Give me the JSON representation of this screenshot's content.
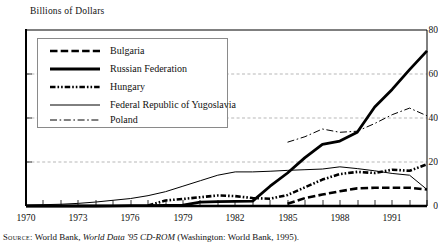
{
  "axis_title": "Billions of Dollars",
  "source": {
    "label": "Source:",
    "text_before": "World Bank,",
    "italic": "World Data '95 CD-ROM",
    "text_after": "(Washington: World Bank, 1995)."
  },
  "legend": {
    "entries": [
      {
        "label": "Bulgaria",
        "style": "thick-dashed"
      },
      {
        "label": "Russian Federation",
        "style": "thick-solid"
      },
      {
        "label": "Hungary",
        "style": "thick-dash-dot-dot"
      },
      {
        "label": "Federal Republic of Yugoslavia",
        "style": "thin-solid"
      },
      {
        "label": "Poland",
        "style": "thin-dash-dot"
      }
    ]
  },
  "chart_data": {
    "type": "line",
    "title": "Billions of Dollars",
    "xlabel": "",
    "ylabel": "Billions of Dollars",
    "xlim": [
      1970,
      1993
    ],
    "ylim": [
      0,
      80
    ],
    "yticks": [
      0,
      20,
      40,
      60,
      80
    ],
    "xticks": [
      1970,
      1973,
      1976,
      1979,
      1982,
      1985,
      1988,
      1991
    ],
    "xtick_labels": [
      "1970",
      "1973",
      "1976",
      "1979",
      "1982",
      "1985",
      "1988",
      "1991"
    ],
    "ytick_labels": [
      "0",
      "20",
      "40",
      "60",
      "80"
    ],
    "grid": "horizontal-dashed",
    "legend_position": "upper-left-inset",
    "x": [
      1970,
      1971,
      1972,
      1973,
      1974,
      1975,
      1976,
      1977,
      1978,
      1979,
      1980,
      1981,
      1982,
      1983,
      1984,
      1985,
      1986,
      1987,
      1988,
      1989,
      1990,
      1991,
      1992,
      1993
    ],
    "series": [
      {
        "name": "Bulgaria",
        "style": "thick-dashed",
        "x": [
          1985,
          1986,
          1987,
          1988,
          1989,
          1990,
          1991,
          1992,
          1993
        ],
        "values": [
          1.0,
          3.6,
          5.2,
          6.7,
          8.0,
          8.3,
          8.3,
          8.3,
          7.5
        ]
      },
      {
        "name": "Russian Federation",
        "style": "thick-solid",
        "x": [
          1970,
          1971,
          1972,
          1973,
          1974,
          1975,
          1976,
          1977,
          1978,
          1979,
          1980,
          1981,
          1982,
          1983,
          1984,
          1985,
          1986,
          1987,
          1988,
          1989,
          1990,
          1991,
          1992,
          1993
        ],
        "values": [
          0.0,
          0.0,
          0.0,
          0.0,
          0.0,
          0.1,
          0.2,
          0.2,
          0.3,
          0.4,
          1.8,
          2.0,
          2.1,
          2.2,
          9.0,
          15.0,
          22.0,
          28.0,
          29.5,
          33.5,
          45.0,
          53.0,
          62.0,
          70.5
        ]
      },
      {
        "name": "Hungary",
        "style": "thick-dash-dot-dot",
        "x": [
          1977,
          1978,
          1979,
          1980,
          1981,
          1982,
          1983,
          1984,
          1985,
          1986,
          1987,
          1988,
          1989,
          1990,
          1991,
          1992,
          1993
        ],
        "values": [
          0.2,
          2.5,
          3.2,
          4.0,
          4.8,
          4.5,
          3.6,
          3.3,
          5.0,
          8.5,
          12.0,
          14.5,
          15.5,
          15.0,
          16.5,
          16.0,
          19.0
        ]
      },
      {
        "name": "Federal Republic of Yugoslavia",
        "style": "thin-solid",
        "x": [
          1970,
          1971,
          1972,
          1973,
          1974,
          1975,
          1976,
          1977,
          1978,
          1979,
          1980,
          1981,
          1982,
          1983,
          1984,
          1985,
          1986,
          1987,
          1988,
          1989,
          1990,
          1991,
          1992,
          1993
        ],
        "values": [
          0.4,
          0.6,
          0.8,
          1.2,
          1.8,
          2.6,
          3.4,
          4.7,
          6.5,
          9.0,
          11.5,
          14.0,
          15.5,
          15.5,
          15.8,
          16.2,
          16.5,
          16.8,
          17.8,
          17.0,
          16.0,
          14.8,
          14.0,
          7.5
        ]
      },
      {
        "name": "Poland",
        "style": "thin-dash-dot",
        "x": [
          1985,
          1986,
          1987,
          1988,
          1989,
          1990,
          1991,
          1992,
          1993
        ],
        "values": [
          29.0,
          31.5,
          35.0,
          33.5,
          34.0,
          37.5,
          41.5,
          44.5,
          41.0
        ]
      }
    ]
  }
}
